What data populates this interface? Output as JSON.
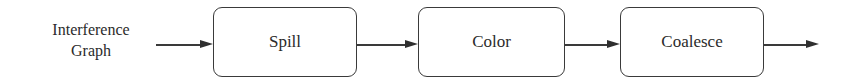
{
  "diagram": {
    "type": "flowchart",
    "direction": "left-to-right",
    "input": {
      "line1": "Interference",
      "line2": "Graph"
    },
    "nodes": [
      {
        "id": "spill",
        "label": "Spill"
      },
      {
        "id": "color",
        "label": "Color"
      },
      {
        "id": "coalesce",
        "label": "Coalesce"
      }
    ],
    "edges": [
      {
        "from": "input",
        "to": "spill"
      },
      {
        "from": "spill",
        "to": "color"
      },
      {
        "from": "color",
        "to": "coalesce"
      },
      {
        "from": "coalesce",
        "to": "output"
      }
    ],
    "colors": {
      "stroke": "#3a3a3a",
      "text": "#2b2b2b",
      "background": "#ffffff"
    }
  }
}
